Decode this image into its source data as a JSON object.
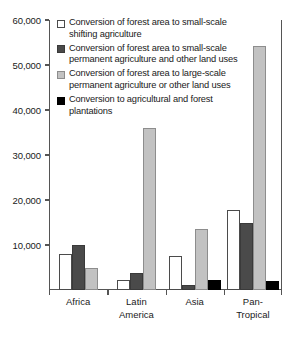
{
  "chart_data": {
    "type": "bar",
    "title": "",
    "subtitle": "",
    "xlabel": "",
    "ylabel": "",
    "ylim": [
      0,
      60000
    ],
    "ytick_labels": [
      "60,000",
      "50,000",
      "40,000",
      "30,000",
      "20,000",
      "10,000"
    ],
    "ytick_values": [
      60000,
      50000,
      40000,
      30000,
      20000,
      10000
    ],
    "grid": false,
    "legend_position": "top-left-inside",
    "categories": [
      "Africa",
      "Latin America",
      "Asia",
      "Pan-Tropical"
    ],
    "category_lines": [
      [
        "Africa"
      ],
      [
        "Latin",
        "America"
      ],
      [
        "Asia"
      ],
      [
        "Pan-",
        "Tropical"
      ]
    ],
    "series": [
      {
        "name": "Conversion of forest area to small-scale shifting agriculture",
        "name_lines": [
          "Conversion of forest area to small-scale",
          "shifting agriculture"
        ],
        "swatch": "white",
        "color": "#ffffff",
        "values": [
          8000,
          2200,
          7500,
          17800
        ]
      },
      {
        "name": "Conversion of forest area to small-scale permanent agriculture and other land uses",
        "name_lines": [
          "Conversion of forest area to small-scale",
          "permanent agriculture and other land uses"
        ],
        "swatch": "dark",
        "color": "#4a4a4a",
        "values": [
          9900,
          3800,
          1200,
          15000
        ]
      },
      {
        "name": "Conversion of forest area to large-scale permanent agriculture or other land uses",
        "name_lines": [
          "Conversion of forest area to large-scale",
          "permanent agriculture or other land uses"
        ],
        "swatch": "light",
        "color": "#c2c2c2",
        "values": [
          5000,
          36000,
          13500,
          54200
        ]
      },
      {
        "name": "Conversion to agricultural and forest plantations",
        "name_lines": [
          "Conversion to agricultural and forest",
          "plantations"
        ],
        "swatch": "black",
        "color": "#000000",
        "values": [
          0,
          0,
          2300,
          2000
        ]
      }
    ]
  }
}
